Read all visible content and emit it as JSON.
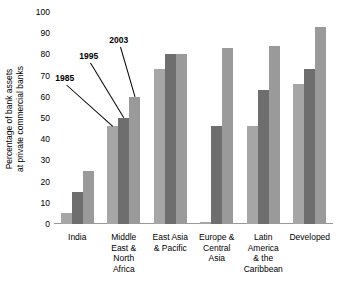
{
  "chart_data": {
    "type": "bar",
    "title": "",
    "xlabel": "",
    "ylabel": "Percentage of bank assets at private commercial banks",
    "ylabel_line1": "Percentage of bank assets",
    "ylabel_line2": "at private commercial banks",
    "ylim": [
      0,
      100
    ],
    "ytick_step": 10,
    "yticks": [
      100,
      90,
      80,
      70,
      60,
      50,
      40,
      30,
      20,
      10,
      0
    ],
    "grid": false,
    "legend_position": "none",
    "annotations": [
      "1985",
      "1995",
      "2003"
    ],
    "annotation_target_group": "Middle East & North Africa",
    "categories": [
      "India",
      "Middle East & North Africa",
      "East Asia & Pacific",
      "Europe & Central Asia",
      "Latin America & the Caribbean",
      "Developed"
    ],
    "category_lines": [
      [
        "India"
      ],
      [
        "Middle",
        "East &",
        "North",
        "Africa"
      ],
      [
        "East Asia",
        "& Pacific"
      ],
      [
        "Europe &",
        "Central",
        "Asia"
      ],
      [
        "Latin",
        "America",
        "& the",
        "Caribbean"
      ],
      [
        "Developed"
      ]
    ],
    "series": [
      {
        "name": "1985",
        "color": "#a6a6a6",
        "values": [
          5,
          46,
          73,
          1,
          46,
          66
        ]
      },
      {
        "name": "1995",
        "color": "#6e6e6e",
        "values": [
          15,
          50,
          80,
          46,
          63,
          73
        ]
      },
      {
        "name": "2003",
        "color": "#9a9a9a",
        "values": [
          25,
          60,
          80,
          83,
          84,
          93
        ]
      }
    ]
  },
  "colors": {
    "bar_1985": "#a6a6a6",
    "bar_1995": "#6e6e6e",
    "bar_2003": "#9a9a9a",
    "axis": "#9a9a9a",
    "text": "#000000",
    "background": "#ffffff"
  }
}
